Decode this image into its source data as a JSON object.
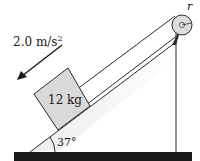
{
  "diagram": {
    "type": "physics-incline-pulley",
    "acceleration": {
      "value": "2.0 m/s",
      "exponent": "2",
      "direction": "down-incline"
    },
    "block": {
      "label": "12 kg"
    },
    "incline": {
      "angle_label": "37°"
    },
    "pulley": {
      "label": "r"
    },
    "colors": {
      "ground": "#1a1a1a",
      "block_fill": "#d9d9d9",
      "incline_shade": "#ececec",
      "pulley_fill": "#dcdcdc",
      "line": "#2a2a2a"
    }
  }
}
